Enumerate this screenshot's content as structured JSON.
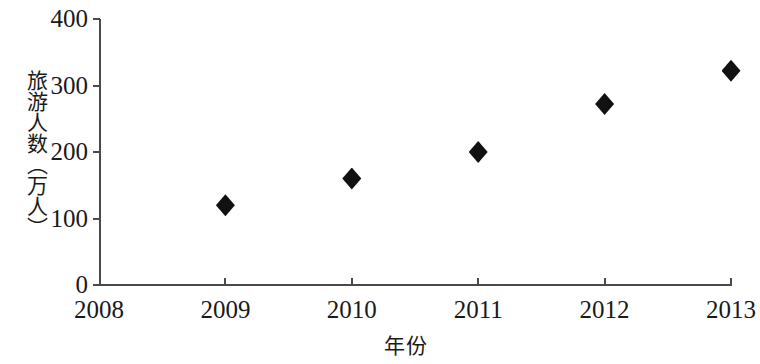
{
  "chart_data": {
    "type": "scatter",
    "title": "",
    "xlabel": "年份",
    "ylabel": "旅游人数（万人）",
    "categories": [
      "2008",
      "2009",
      "2010",
      "2011",
      "2012",
      "2013"
    ],
    "x": [
      2008,
      2009,
      2010,
      2011,
      2012,
      2013
    ],
    "values": [
      null,
      120,
      160,
      200,
      272,
      322
    ],
    "points": [
      {
        "x": "2009",
        "y": 120
      },
      {
        "x": "2010",
        "y": 160
      },
      {
        "x": "2011",
        "y": 200
      },
      {
        "x": "2012",
        "y": 272
      },
      {
        "x": "2013",
        "y": 322
      }
    ],
    "xlim": [
      2008,
      2013
    ],
    "ylim": [
      0,
      400
    ],
    "y_ticks": [
      "0",
      "100",
      "200",
      "300",
      "400"
    ],
    "y_tick_values": [
      0,
      100,
      200,
      300,
      400
    ],
    "x_ticks": [
      "2008",
      "2009",
      "2010",
      "2011",
      "2012",
      "2013"
    ],
    "grid": false,
    "legend": null,
    "marker": "diamond",
    "marker_color": "#111111",
    "axis_color": "#4a4a4a",
    "background_color": "#ffffff"
  },
  "axes": {
    "y_title": "旅游人数（万人）",
    "x_title": "年份"
  }
}
